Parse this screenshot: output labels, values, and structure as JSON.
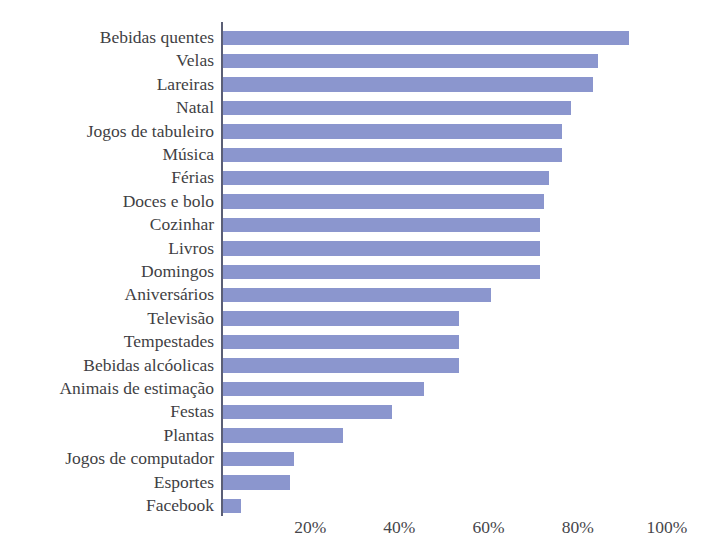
{
  "chart_data": {
    "type": "bar",
    "orientation": "horizontal",
    "title": "",
    "xlabel": "",
    "ylabel": "",
    "xlim": [
      0,
      100
    ],
    "x_tick_labels": [
      "0%",
      "20%",
      "40%",
      "60%",
      "80%",
      "100%"
    ],
    "x_tick_values": [
      0,
      20,
      40,
      60,
      80,
      100
    ],
    "grid": false,
    "legend": null,
    "value_suffix": "%",
    "series_color": "#8b96ce",
    "axis_color": "#5b5f76",
    "categories": [
      "Bebidas quentes",
      "Velas",
      "Lareiras",
      "Natal",
      "Jogos de tabuleiro",
      "Música",
      "Férias",
      "Doces e bolo",
      "Cozinhar",
      "Livros",
      "Domingos",
      "Aniversários",
      "Televisão",
      "Tempestades",
      "Bebidas alcóolicas",
      "Animais de estimação",
      "Festas",
      "Plantas",
      "Jogos de computador",
      "Esportes",
      "Facebook"
    ],
    "values": [
      91,
      84,
      83,
      78,
      76,
      76,
      73,
      72,
      71,
      71,
      71,
      60,
      53,
      53,
      53,
      45,
      38,
      27,
      16,
      15,
      4
    ]
  },
  "axis": {
    "ticks": [
      {
        "label": "0%",
        "value": 0,
        "visible": false
      },
      {
        "label": "20%",
        "value": 20,
        "visible": true
      },
      {
        "label": "40%",
        "value": 40,
        "visible": true
      },
      {
        "label": "60%",
        "value": 60,
        "visible": true
      },
      {
        "label": "80%",
        "value": 80,
        "visible": true
      },
      {
        "label": "100%",
        "value": 100,
        "visible": true
      }
    ]
  },
  "title_sliver": "Coisas que mais nos deixam felizes"
}
